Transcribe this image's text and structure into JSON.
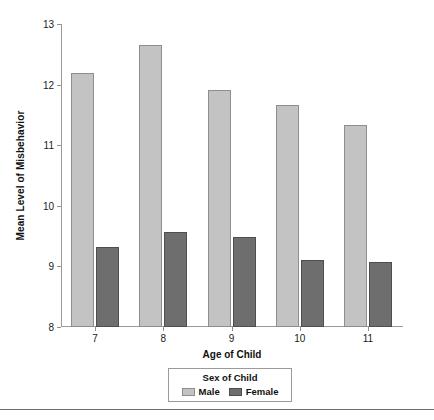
{
  "chart_data": {
    "type": "bar",
    "title": "",
    "xlabel": "Age of Child",
    "ylabel": "Mean Level of Misbehavior",
    "categories": [
      "7",
      "8",
      "9",
      "10",
      "11"
    ],
    "ylim": [
      8,
      13
    ],
    "yticks": [
      "8",
      "9",
      "10",
      "11",
      "12",
      "13"
    ],
    "grid": false,
    "legend": {
      "title": "Sex of Child",
      "position": "bottom",
      "entries": [
        "Male",
        "Female"
      ]
    },
    "series": [
      {
        "name": "Male",
        "color": "#c3c3c3",
        "values": [
          12.19,
          12.66,
          11.91,
          11.67,
          11.34
        ]
      },
      {
        "name": "Female",
        "color": "#6e6e6e",
        "values": [
          9.32,
          9.56,
          9.49,
          9.11,
          9.08
        ]
      }
    ]
  },
  "colors": {
    "male": "#c3c3c3",
    "male_border": "#8e8e8e",
    "female": "#6e6e6e",
    "female_border": "#4e4e4e",
    "axis": "#9a9a9a",
    "text": "#111111",
    "background": "#ffffff"
  }
}
